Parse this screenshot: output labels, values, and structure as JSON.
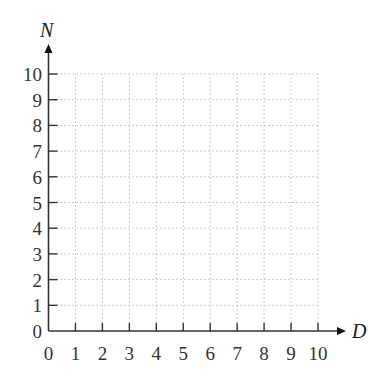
{
  "chart_data": {
    "type": "scatter",
    "title": "",
    "xlabel": "D",
    "ylabel": "N",
    "x_ticks": [
      "0",
      "1",
      "2",
      "3",
      "4",
      "5",
      "6",
      "7",
      "8",
      "9",
      "10"
    ],
    "y_ticks": [
      "0",
      "1",
      "2",
      "3",
      "4",
      "5",
      "6",
      "7",
      "8",
      "9",
      "10"
    ],
    "xlim": [
      0,
      10
    ],
    "ylim": [
      0,
      10
    ],
    "grid": true,
    "grid_style": "dotted",
    "series": [],
    "legend": null
  },
  "colors": {
    "axis": "#333333",
    "grid": "#bbbbbb",
    "text": "#333333"
  }
}
